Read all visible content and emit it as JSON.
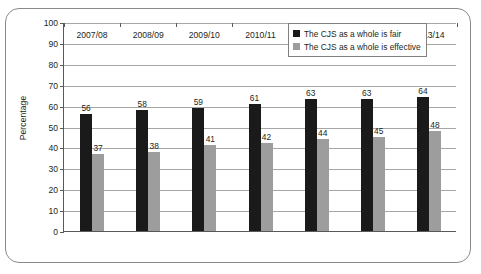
{
  "chart_data": {
    "type": "bar",
    "title": "",
    "xlabel": "",
    "ylabel": "Percentage",
    "ylim": [
      0,
      100
    ],
    "ytick_step": 10,
    "yticks": [
      100,
      90,
      80,
      70,
      60,
      50,
      40,
      30,
      20,
      10,
      0
    ],
    "grid": "horizontal",
    "legend_position": "top-right",
    "categories": [
      "2007/08",
      "2008/09",
      "2009/10",
      "2010/11",
      "2011/12",
      "2012/13",
      "2013/14"
    ],
    "series": [
      {
        "name": "The CJS as a whole is fair",
        "color": "#1a1a1a",
        "values": [
          56,
          58,
          59,
          61,
          63,
          63,
          64
        ]
      },
      {
        "name": "The CJS as a whole is effective",
        "color": "#9d9d9d",
        "values": [
          37,
          38,
          41,
          42,
          44,
          45,
          48
        ]
      }
    ]
  },
  "legend": {
    "items": [
      {
        "label": "The CJS as a whole is fair",
        "color": "#1a1a1a"
      },
      {
        "label": "The CJS as a whole is effective",
        "color": "#9d9d9d"
      }
    ]
  }
}
